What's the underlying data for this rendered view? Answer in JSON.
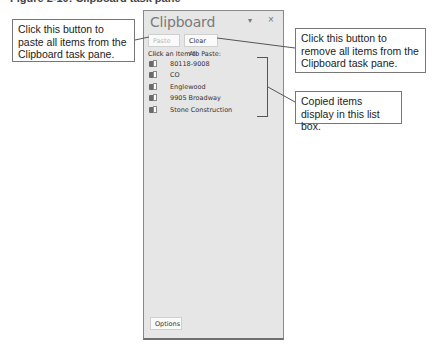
{
  "caption": "Figure 2-10: Clipboard task pane",
  "pane": {
    "title": "Clipboard",
    "menu_icon": "dropdown-arrow-icon",
    "menu_glyph": "▾",
    "close_icon": "close-icon",
    "close_glyph": "×",
    "paste_all_label": "Paste All",
    "paste_all_enabled": false,
    "clear_all_label": "Clear All",
    "list_label": "Click an Item to Paste:",
    "items": [
      {
        "label": "80118-9008",
        "icon": "clipboard-text-icon"
      },
      {
        "label": "CO",
        "icon": "clipboard-text-icon"
      },
      {
        "label": "Englewood",
        "icon": "clipboard-text-icon"
      },
      {
        "label": "9905 Broadway",
        "icon": "clipboard-text-icon"
      },
      {
        "label": "Stone Construction",
        "icon": "clipboard-text-icon"
      }
    ],
    "options_label": "Options"
  },
  "callouts": {
    "paste_all": "Click this button to paste all items from the Clipboard task pane.",
    "clear_all": "Click this button to remove all items from the Clipboard task pane.",
    "list_box": "Copied items display in this list box."
  },
  "colors": {
    "pane_bg": "#e6e6e6",
    "pane_border": "#8a8a8a",
    "callout_border": "#777777"
  }
}
